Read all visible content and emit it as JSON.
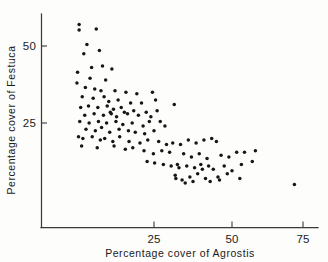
{
  "chart_data": {
    "type": "scatter",
    "title": "",
    "xlabel": "Percentage  cover of Agrostis",
    "ylabel": "Percentage  cover  of  Festuca",
    "xlim": [
      0,
      80
    ],
    "ylim": [
      0,
      65
    ],
    "grid": false,
    "legend": null,
    "xticks": [
      25,
      50,
      75
    ],
    "xtick_labels": [
      "25",
      "50",
      "75"
    ],
    "yticks": [
      25,
      50
    ],
    "ytick_labels": [
      "25",
      "50"
    ],
    "marker": "filled-circle",
    "marker_color": "#161616",
    "axis_color": "#3a3a3a",
    "n_points": 135,
    "series": [
      {
        "name": "quadrat",
        "points": [
          [
            1.0,
            57.0
          ],
          [
            1.0,
            55.2
          ],
          [
            6.5,
            55.5
          ],
          [
            3.5,
            50.5
          ],
          [
            2.5,
            47.5
          ],
          [
            7.5,
            48.5
          ],
          [
            0.5,
            41.5
          ],
          [
            5.0,
            43.0
          ],
          [
            8.5,
            43.5
          ],
          [
            11.5,
            42.5
          ],
          [
            0.3,
            38.0
          ],
          [
            4.5,
            39.5
          ],
          [
            9.5,
            39.0
          ],
          [
            3.0,
            36.5
          ],
          [
            6.0,
            36.0
          ],
          [
            8.0,
            35.5
          ],
          [
            12.5,
            35.5
          ],
          [
            16.0,
            35.0
          ],
          [
            19.5,
            34.5
          ],
          [
            24.5,
            35.0
          ],
          [
            25.5,
            32.5
          ],
          [
            2.0,
            33.5
          ],
          [
            5.5,
            33.0
          ],
          [
            9.0,
            33.5
          ],
          [
            10.5,
            32.0
          ],
          [
            13.5,
            32.5
          ],
          [
            17.5,
            31.5
          ],
          [
            21.0,
            31.5
          ],
          [
            1.5,
            30.0
          ],
          [
            4.0,
            30.5
          ],
          [
            7.0,
            30.0
          ],
          [
            10.0,
            30.5
          ],
          [
            12.0,
            29.5
          ],
          [
            14.5,
            30.0
          ],
          [
            18.5,
            29.0
          ],
          [
            22.5,
            28.5
          ],
          [
            26.0,
            29.0
          ],
          [
            31.5,
            31.0
          ],
          [
            2.8,
            27.5
          ],
          [
            5.8,
            28.0
          ],
          [
            8.8,
            27.5
          ],
          [
            11.0,
            28.5
          ],
          [
            11.3,
            28.0
          ],
          [
            13.0,
            27.0
          ],
          [
            15.5,
            28.5
          ],
          [
            16.5,
            28.0
          ],
          [
            20.0,
            27.5
          ],
          [
            24.0,
            27.0
          ],
          [
            1.2,
            25.5
          ],
          [
            4.2,
            25.0
          ],
          [
            7.2,
            25.5
          ],
          [
            9.8,
            25.0
          ],
          [
            12.8,
            25.5
          ],
          [
            15.0,
            24.5
          ],
          [
            18.0,
            25.0
          ],
          [
            21.5,
            24.0
          ],
          [
            23.5,
            25.5
          ],
          [
            27.0,
            25.5
          ],
          [
            28.5,
            24.0
          ],
          [
            3.2,
            23.0
          ],
          [
            6.2,
            22.5
          ],
          [
            8.2,
            23.5
          ],
          [
            10.8,
            22.0
          ],
          [
            13.8,
            23.0
          ],
          [
            16.8,
            22.5
          ],
          [
            19.0,
            22.0
          ],
          [
            22.0,
            21.5
          ],
          [
            25.0,
            22.5
          ],
          [
            0.8,
            20.5
          ],
          [
            2.2,
            20.0
          ],
          [
            5.2,
            20.5
          ],
          [
            7.8,
            19.5
          ],
          [
            9.2,
            20.0
          ],
          [
            11.8,
            19.0
          ],
          [
            14.0,
            20.5
          ],
          [
            17.0,
            19.0
          ],
          [
            20.5,
            18.5
          ],
          [
            23.0,
            19.5
          ],
          [
            26.5,
            19.0
          ],
          [
            29.0,
            18.0
          ],
          [
            31.0,
            18.5
          ],
          [
            33.5,
            18.0
          ],
          [
            36.0,
            19.5
          ],
          [
            38.5,
            18.5
          ],
          [
            41.0,
            19.5
          ],
          [
            43.5,
            20.0
          ],
          [
            45.0,
            19.0
          ],
          [
            1.8,
            17.5
          ],
          [
            6.8,
            17.0
          ],
          [
            12.2,
            17.5
          ],
          [
            15.8,
            16.5
          ],
          [
            18.2,
            17.0
          ],
          [
            21.8,
            16.0
          ],
          [
            24.8,
            15.0
          ],
          [
            27.5,
            16.0
          ],
          [
            30.0,
            15.5
          ],
          [
            34.5,
            15.0
          ],
          [
            37.0,
            14.0
          ],
          [
            39.5,
            15.0
          ],
          [
            42.0,
            13.5
          ],
          [
            46.5,
            14.5
          ],
          [
            49.0,
            14.0
          ],
          [
            51.5,
            15.5
          ],
          [
            54.0,
            15.5
          ],
          [
            57.5,
            16.0
          ],
          [
            22.8,
            12.5
          ],
          [
            25.2,
            12.0
          ],
          [
            28.0,
            11.5
          ],
          [
            30.5,
            11.0
          ],
          [
            32.5,
            11.5
          ],
          [
            33.0,
            10.5
          ],
          [
            35.5,
            11.0
          ],
          [
            38.0,
            10.5
          ],
          [
            40.0,
            11.5
          ],
          [
            40.5,
            10.0
          ],
          [
            42.5,
            11.0
          ],
          [
            44.0,
            10.0
          ],
          [
            47.5,
            11.0
          ],
          [
            53.0,
            11.5
          ],
          [
            56.5,
            12.5
          ],
          [
            31.8,
            8.0
          ],
          [
            32.0,
            7.0
          ],
          [
            34.0,
            6.5
          ],
          [
            36.5,
            7.5
          ],
          [
            37.5,
            6.0
          ],
          [
            39.0,
            8.5
          ],
          [
            41.5,
            7.0
          ],
          [
            43.0,
            6.0
          ],
          [
            45.5,
            7.5
          ],
          [
            46.0,
            6.5
          ],
          [
            48.5,
            8.5
          ],
          [
            50.0,
            9.5
          ],
          [
            52.5,
            7.0
          ],
          [
            35.0,
            5.5
          ],
          [
            70.0,
            5.0
          ]
        ]
      }
    ]
  },
  "figure": {
    "axis_color": "#3a3a3a",
    "background": "#fdfdfc"
  }
}
